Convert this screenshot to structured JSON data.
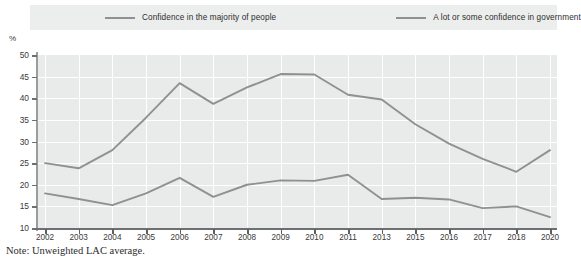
{
  "legend": {
    "items": [
      {
        "label": "Confidence in the majority of people",
        "color": "#8e9194",
        "name": "legend-item-people"
      },
      {
        "label": "A lot or some confidence in government",
        "color": "#8e9194",
        "name": "legend-item-government"
      }
    ]
  },
  "axis": {
    "y_unit": "%",
    "y_ticks": [
      "50",
      "45",
      "40",
      "35",
      "30",
      "25",
      "20",
      "15",
      "10"
    ],
    "x_ticks": [
      "2002",
      "2003",
      "2004",
      "2005",
      "2006",
      "2007",
      "2008",
      "2009",
      "2010",
      "2011",
      "2013",
      "2015",
      "2016",
      "2017",
      "2018",
      "2020"
    ]
  },
  "note": "Note: Unweighted LAC average.",
  "chart_data": {
    "type": "line",
    "title": "",
    "subtitle": "",
    "xlabel": "",
    "ylabel": "%",
    "ylim": [
      10,
      50
    ],
    "grid": true,
    "legend_position": "top",
    "categories": [
      "2002",
      "2003",
      "2004",
      "2005",
      "2006",
      "2007",
      "2008",
      "2009",
      "2010",
      "2011",
      "2013",
      "2015",
      "2016",
      "2017",
      "2018",
      "2020"
    ],
    "series": [
      {
        "name": "A lot or some confidence in government",
        "color": "#8e9194",
        "values": [
          25.0,
          23.8,
          28.0,
          35.5,
          43.5,
          38.7,
          42.5,
          45.6,
          45.5,
          40.8,
          39.7,
          34.0,
          29.5,
          26.0,
          23.0,
          28.0
        ]
      },
      {
        "name": "Confidence in the majority of people",
        "color": "#8e9194",
        "values": [
          18.0,
          16.7,
          15.3,
          18.0,
          21.6,
          17.2,
          20.0,
          21.0,
          20.9,
          22.3,
          16.7,
          17.0,
          16.6,
          14.6,
          15.0,
          12.5
        ]
      }
    ],
    "annotations": [
      "Note: Unweighted LAC average."
    ]
  }
}
